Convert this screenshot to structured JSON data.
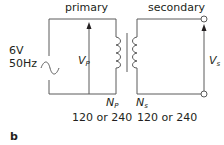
{
  "figure": {
    "panel_label": "b",
    "primary": {
      "heading": "primary",
      "source_voltage": "6V",
      "source_frequency": "50Hz",
      "voltage_symbol": "V",
      "voltage_subscript": "P",
      "turns_symbol": "N",
      "turns_subscript": "P",
      "turns_value": "120 or 240"
    },
    "secondary": {
      "heading": "secondary",
      "voltage_symbol": "V",
      "voltage_subscript": "s",
      "turns_symbol": "N",
      "turns_subscript": "s",
      "turns_value": "120 or 240"
    },
    "colors": {
      "wire": "#5a5a5a",
      "text": "#231f20",
      "background": "#ffffff"
    }
  }
}
